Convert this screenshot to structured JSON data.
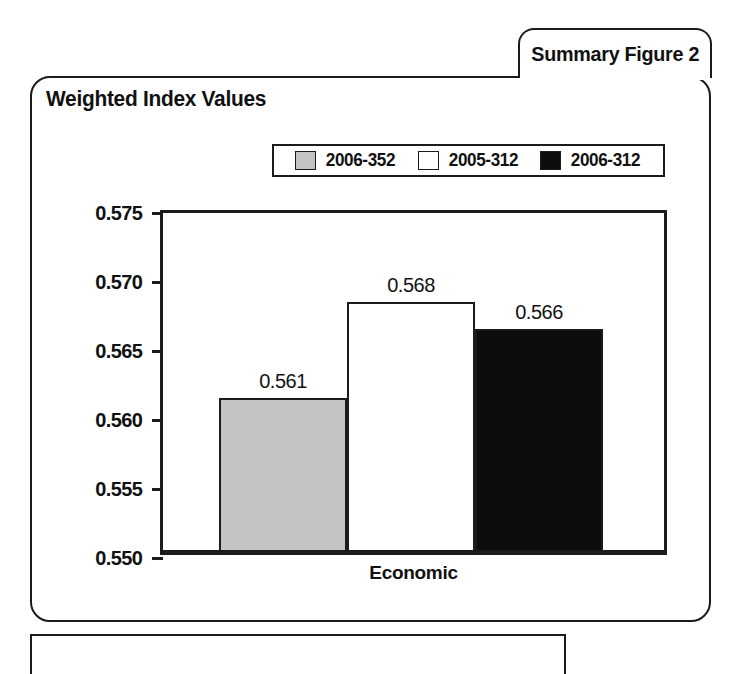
{
  "figure_tab": {
    "label": "Summary Figure 2"
  },
  "chart": {
    "title": "Weighted Index Values"
  },
  "colors": {
    "series_gray": "#c3c3c3",
    "series_white": "#ffffff",
    "series_black": "#0d0d0d",
    "ink": "#1b1b1b",
    "background": "#ffffff"
  },
  "chart_data": {
    "type": "bar",
    "title": "Weighted Index Values",
    "xlabel": "",
    "ylabel": "",
    "categories": [
      "Economic"
    ],
    "ylim": [
      0.55,
      0.575
    ],
    "ytick_labels": [
      "0.575",
      "0.570",
      "0.565",
      "0.560",
      "0.555",
      "0.550"
    ],
    "yticks": [
      0.575,
      0.57,
      0.565,
      0.56,
      0.555,
      0.55
    ],
    "grid": false,
    "legend_position": "top",
    "series": [
      {
        "name": "2006-352",
        "color": "#c3c3c3",
        "values": [
          0.561
        ],
        "value_labels": [
          "0.561"
        ]
      },
      {
        "name": "2005-312",
        "color": "#ffffff",
        "values": [
          0.568
        ],
        "value_labels": [
          "0.568"
        ]
      },
      {
        "name": "2006-312",
        "color": "#0d0d0d",
        "values": [
          0.566
        ],
        "value_labels": [
          "0.566"
        ]
      }
    ]
  }
}
